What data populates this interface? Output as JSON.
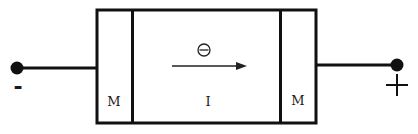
{
  "diagram": {
    "type": "metal-insulator-metal junction",
    "colors": {
      "stroke": "#111111",
      "background": "#ffffff",
      "label": "#1a1a1a"
    },
    "left_terminal": {
      "polarity_label": "-",
      "icon": "terminal-dot"
    },
    "right_terminal": {
      "polarity_label": "+",
      "icon": "terminal-dot"
    },
    "regions": [
      {
        "label": "M",
        "role": "left-metal"
      },
      {
        "label": "I",
        "role": "insulator"
      },
      {
        "label": "M",
        "role": "right-metal"
      }
    ],
    "carrier": {
      "symbol": "⊖",
      "meaning": "electron",
      "direction": "left-to-right"
    }
  }
}
